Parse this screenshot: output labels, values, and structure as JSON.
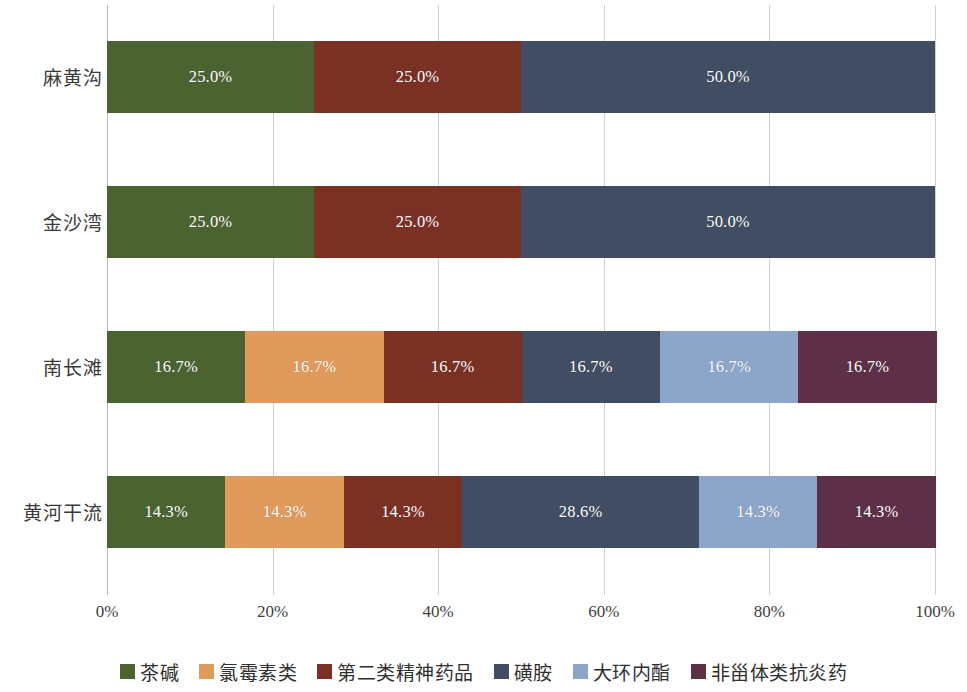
{
  "chart_data": {
    "type": "bar",
    "orientation": "horizontal",
    "stacked": true,
    "normalized_percent": true,
    "title": "",
    "subtitle": "",
    "xlabel": "",
    "ylabel": "",
    "xlim": [
      0,
      100
    ],
    "grid": true,
    "legend_position": "bottom",
    "xticks": [
      "0%",
      "20%",
      "40%",
      "60%",
      "80%",
      "100%"
    ],
    "xtick_values": [
      0,
      20,
      40,
      60,
      80,
      100
    ],
    "categories": [
      "麻黄沟",
      "金沙湾",
      "南长滩",
      "黄河干流"
    ],
    "series": [
      {
        "name": "茶碱",
        "color": "#4A6331",
        "values": [
          25.0,
          25.0,
          16.7,
          14.3
        ]
      },
      {
        "name": "氯霉素类",
        "color": "#E09A5C",
        "values": [
          0,
          0,
          16.7,
          14.3
        ]
      },
      {
        "name": "第二类精神药品",
        "color": "#7B3024",
        "values": [
          25.0,
          25.0,
          16.7,
          14.3
        ]
      },
      {
        "name": "磺胺",
        "color": "#414D63",
        "values": [
          50.0,
          50.0,
          16.7,
          28.6
        ]
      },
      {
        "name": "大环内酯",
        "color": "#8CA5C8",
        "values": [
          0,
          0,
          16.7,
          14.3
        ]
      },
      {
        "name": "非甾体类抗炎药",
        "color": "#5E3048",
        "values": [
          0,
          0,
          16.7,
          14.3
        ]
      }
    ],
    "data_labels": {
      "麻黄沟": [
        "25.0%",
        "",
        "25.0%",
        "50.0%",
        "",
        ""
      ],
      "金沙湾": [
        "25.0%",
        "",
        "25.0%",
        "50.0%",
        "",
        ""
      ],
      "南长滩": [
        "16.7%",
        "16.7%",
        "16.7%",
        "16.7%",
        "16.7%",
        "16.7%"
      ],
      "黄河干流": [
        "14.3%",
        "14.3%",
        "14.3%",
        "28.6%",
        "14.3%",
        "14.3%"
      ]
    }
  },
  "axis": {
    "y_labels": [
      "麻黄沟",
      "金沙湾",
      "南长滩",
      "黄河干流"
    ],
    "x_labels": [
      "0%",
      "20%",
      "40%",
      "60%",
      "80%",
      "100%"
    ]
  },
  "legend": {
    "items": [
      {
        "label": "茶碱",
        "color": "#4A6331"
      },
      {
        "label": "氯霉素类",
        "color": "#E09A5C"
      },
      {
        "label": "第二类精神药品",
        "color": "#7B3024"
      },
      {
        "label": "磺胺",
        "color": "#414D63"
      },
      {
        "label": "大环内酯",
        "color": "#8CA5C8"
      },
      {
        "label": "非甾体类抗炎药",
        "color": "#5E3048"
      }
    ]
  }
}
